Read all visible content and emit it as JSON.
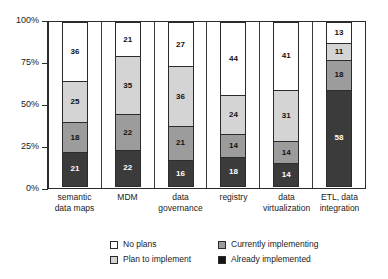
{
  "chart_data": {
    "type": "bar",
    "variant": "stacked-100-percent",
    "title": "",
    "xlabel": "",
    "ylabel": "",
    "ylim": [
      0,
      100
    ],
    "ytick_labels": [
      "100%",
      "75%",
      "50%",
      "25%",
      "0%"
    ],
    "ytick_values": [
      100,
      75,
      50,
      25,
      0
    ],
    "grid": false,
    "legend_position": "bottom",
    "stack_order_bottom_to_top": [
      "Already implemented",
      "Currently implementing",
      "Plan to implement",
      "No plans"
    ],
    "categories": [
      "semantic data maps",
      "MDM",
      "data governance",
      "registry",
      "data virtualization",
      "ETL, data integration"
    ],
    "category_label_lines": [
      [
        "semantic",
        "data maps"
      ],
      [
        "MDM"
      ],
      [
        "data",
        "governance"
      ],
      [
        "registry"
      ],
      [
        "data",
        "virtualization"
      ],
      [
        "ETL, data",
        "integration"
      ]
    ],
    "series": [
      {
        "name": "No plans",
        "key": "noplans",
        "color": "#ffffff",
        "values": [
          36,
          21,
          27,
          44,
          41,
          13
        ]
      },
      {
        "name": "Plan to implement",
        "key": "plan",
        "color": "#d4d4d4",
        "values": [
          25,
          35,
          36,
          24,
          31,
          11
        ]
      },
      {
        "name": "Currently implementing",
        "key": "current",
        "color": "#9c9c9c",
        "values": [
          18,
          22,
          21,
          14,
          14,
          18
        ]
      },
      {
        "name": "Already implemented",
        "key": "already",
        "color": "#3b3b3b",
        "values": [
          21,
          22,
          16,
          18,
          14,
          58
        ]
      }
    ]
  },
  "legend": {
    "items": [
      {
        "label": "No plans",
        "key": "noplans"
      },
      {
        "label": "Currently implementing",
        "key": "current"
      },
      {
        "label": "Plan to implement",
        "key": "plan"
      },
      {
        "label": "Already implemented",
        "key": "already"
      }
    ]
  }
}
